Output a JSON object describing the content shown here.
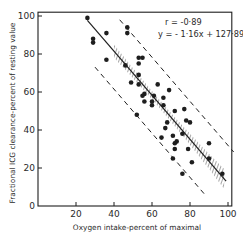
{
  "chart_data": {
    "type": "scatter",
    "title": "",
    "xlabel": "Oxygen intake-percent of maximal",
    "ylabel": "Fractional ICG clearance-percent of resting value",
    "xlim": [
      0,
      103
    ],
    "ylim": [
      0,
      103
    ],
    "x_ticks": [
      20,
      40,
      60,
      80,
      100
    ],
    "y_ticks": [
      0,
      20,
      40,
      60,
      80,
      100
    ],
    "x_tick_labels": [
      "20",
      "40",
      "60",
      "80",
      "100"
    ],
    "y_tick_labels": [
      "0",
      "20",
      "40",
      "60",
      "80",
      "100"
    ],
    "grid": false,
    "legend": null,
    "annotations": [
      "r = -0·89",
      "y = - 1·16x + 127·89"
    ],
    "regression": {
      "slope": -1.16,
      "intercept": 127.89,
      "r": -0.89,
      "x_range": [
        26,
        99
      ],
      "confidence_band": "hatched band around regression line",
      "prediction_limits_offset": 20
    },
    "points": [
      {
        "x": 26,
        "y": 99
      },
      {
        "x": 29,
        "y": 88
      },
      {
        "x": 29,
        "y": 86
      },
      {
        "x": 36,
        "y": 91
      },
      {
        "x": 36,
        "y": 77
      },
      {
        "x": 47,
        "y": 94
      },
      {
        "x": 47,
        "y": 91
      },
      {
        "x": 53,
        "y": 78
      },
      {
        "x": 55,
        "y": 78
      },
      {
        "x": 53,
        "y": 75
      },
      {
        "x": 46,
        "y": 74
      },
      {
        "x": 53,
        "y": 69
      },
      {
        "x": 49,
        "y": 65
      },
      {
        "x": 53,
        "y": 64
      },
      {
        "x": 63,
        "y": 64
      },
      {
        "x": 69,
        "y": 61
      },
      {
        "x": 56,
        "y": 59
      },
      {
        "x": 55,
        "y": 58
      },
      {
        "x": 61,
        "y": 58
      },
      {
        "x": 66,
        "y": 57
      },
      {
        "x": 56,
        "y": 55
      },
      {
        "x": 60,
        "y": 55
      },
      {
        "x": 60,
        "y": 53
      },
      {
        "x": 66,
        "y": 53
      },
      {
        "x": 52,
        "y": 48
      },
      {
        "x": 72,
        "y": 50
      },
      {
        "x": 77,
        "y": 51
      },
      {
        "x": 68,
        "y": 44
      },
      {
        "x": 78,
        "y": 45
      },
      {
        "x": 80,
        "y": 44
      },
      {
        "x": 67,
        "y": 41
      },
      {
        "x": 65,
        "y": 36
      },
      {
        "x": 71,
        "y": 37
      },
      {
        "x": 76,
        "y": 38
      },
      {
        "x": 73,
        "y": 34
      },
      {
        "x": 72,
        "y": 33
      },
      {
        "x": 72,
        "y": 30
      },
      {
        "x": 79,
        "y": 30
      },
      {
        "x": 90,
        "y": 33
      },
      {
        "x": 90,
        "y": 25
      },
      {
        "x": 81,
        "y": 23
      },
      {
        "x": 71,
        "y": 25
      },
      {
        "x": 76,
        "y": 17
      },
      {
        "x": 97,
        "y": 17
      }
    ]
  },
  "colors": {
    "ink": "#1e1e1e",
    "background": "#ffffff"
  }
}
